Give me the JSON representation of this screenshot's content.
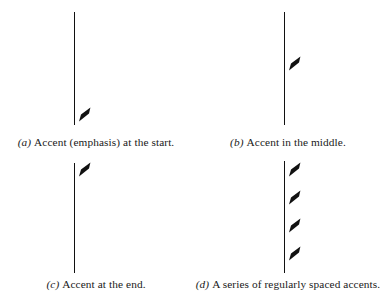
{
  "figure": {
    "kind": "music-notation-figure",
    "background_color": "#ffffff",
    "ink_color": "#111111",
    "panels": [
      {
        "id": "a",
        "label": "(a)",
        "caption": "Accent (emphasis) at the start.",
        "accent_count": 1,
        "accent_position": "start",
        "stem": {
          "x": 74,
          "y_top": 12,
          "y_bottom": 125
        },
        "accents": [
          {
            "x": 78,
            "y": 107
          }
        ]
      },
      {
        "id": "b",
        "label": "(b)",
        "caption": "Accent in the middle.",
        "accent_count": 1,
        "accent_position": "middle",
        "stem": {
          "x": 92,
          "y_top": 12,
          "y_bottom": 125
        },
        "accents": [
          {
            "x": 96,
            "y": 56
          }
        ]
      },
      {
        "id": "c",
        "label": "(c)",
        "caption": "Accent at the end.",
        "accent_count": 1,
        "accent_position": "end",
        "stem": {
          "x": 74,
          "y_top": 8,
          "y_bottom": 118
        },
        "accents": [
          {
            "x": 78,
            "y": 7
          }
        ]
      },
      {
        "id": "d",
        "label": "(d)",
        "caption": "A series of regularly spaced accents.",
        "accent_count": 4,
        "accent_position": "regularly-spaced",
        "stem": {
          "x": 92,
          "y_top": 6,
          "y_bottom": 118
        },
        "accents": [
          {
            "x": 96,
            "y": 7
          },
          {
            "x": 96,
            "y": 35
          },
          {
            "x": 96,
            "y": 63
          },
          {
            "x": 96,
            "y": 91
          }
        ]
      }
    ]
  }
}
